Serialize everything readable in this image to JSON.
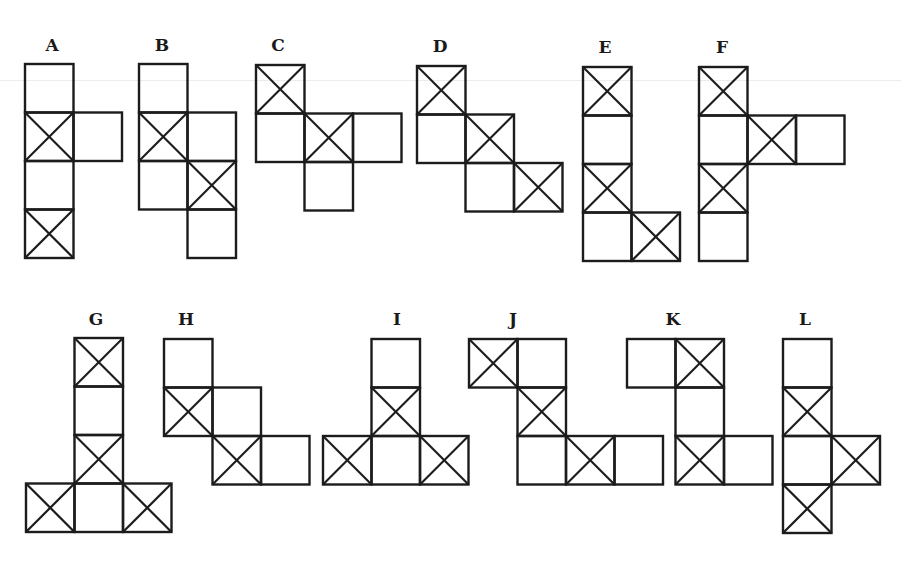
{
  "page": {
    "background": "#ffffff",
    "stroke_color": "#1c1c1c",
    "cell_size": 48.5,
    "top_fragment_text": ""
  },
  "figures": [
    {
      "label": "A",
      "label_x": 52,
      "label_y": 35,
      "x": 24,
      "y": 63,
      "cells": [
        [
          0,
          0,
          false
        ],
        [
          0,
          1,
          true
        ],
        [
          1,
          1,
          false
        ],
        [
          0,
          2,
          false
        ],
        [
          0,
          3,
          true
        ]
      ]
    },
    {
      "label": "B",
      "label_x": 162,
      "label_y": 35,
      "x": 138,
      "y": 63,
      "cells": [
        [
          0,
          0,
          false
        ],
        [
          0,
          1,
          true
        ],
        [
          1,
          1,
          false
        ],
        [
          0,
          2,
          false
        ],
        [
          1,
          2,
          true
        ],
        [
          1,
          3,
          false
        ]
      ]
    },
    {
      "label": "C",
      "label_x": 278,
      "label_y": 35,
      "x": 255,
      "y": 64,
      "cells": [
        [
          0,
          0,
          true
        ],
        [
          0,
          1,
          false
        ],
        [
          1,
          1,
          true
        ],
        [
          2,
          1,
          false
        ],
        [
          1,
          2,
          false
        ]
      ]
    },
    {
      "label": "D",
      "label_x": 440,
      "label_y": 36,
      "x": 416,
      "y": 65,
      "cells": [
        [
          0,
          0,
          true
        ],
        [
          0,
          1,
          false
        ],
        [
          1,
          1,
          true
        ],
        [
          1,
          2,
          false
        ],
        [
          2,
          2,
          true
        ]
      ]
    },
    {
      "label": "E",
      "label_x": 605,
      "label_y": 37,
      "x": 582,
      "y": 66,
      "cells": [
        [
          0,
          0,
          true
        ],
        [
          0,
          1,
          false
        ],
        [
          0,
          2,
          true
        ],
        [
          0,
          3,
          false
        ],
        [
          1,
          3,
          true
        ]
      ]
    },
    {
      "label": "F",
      "label_x": 722,
      "label_y": 37,
      "x": 698,
      "y": 66,
      "cells": [
        [
          0,
          0,
          true
        ],
        [
          0,
          1,
          false
        ],
        [
          1,
          1,
          true
        ],
        [
          2,
          1,
          false
        ],
        [
          0,
          2,
          true
        ],
        [
          0,
          3,
          false
        ]
      ]
    },
    {
      "label": "G",
      "label_x": 96,
      "label_y": 309,
      "x": 25,
      "y": 337,
      "cells": [
        [
          1,
          0,
          true
        ],
        [
          1,
          1,
          false
        ],
        [
          1,
          2,
          true
        ],
        [
          0,
          3,
          true
        ],
        [
          1,
          3,
          false
        ],
        [
          2,
          3,
          true
        ]
      ]
    },
    {
      "label": "H",
      "label_x": 186,
      "label_y": 309,
      "x": 163,
      "y": 338,
      "cells": [
        [
          0,
          0,
          false
        ],
        [
          0,
          1,
          true
        ],
        [
          1,
          1,
          false
        ],
        [
          1,
          2,
          true
        ],
        [
          2,
          2,
          false
        ]
      ]
    },
    {
      "label": "I",
      "label_x": 397,
      "label_y": 309,
      "x": 322,
      "y": 338,
      "cells": [
        [
          1,
          0,
          false
        ],
        [
          1,
          1,
          true
        ],
        [
          0,
          2,
          true
        ],
        [
          1,
          2,
          false
        ],
        [
          2,
          2,
          true
        ]
      ]
    },
    {
      "label": "J",
      "label_x": 513,
      "label_y": 309,
      "x": 468,
      "y": 338,
      "cells": [
        [
          0,
          0,
          true
        ],
        [
          1,
          0,
          false
        ],
        [
          1,
          1,
          true
        ],
        [
          1,
          2,
          false
        ],
        [
          2,
          2,
          true
        ],
        [
          3,
          2,
          false
        ]
      ]
    },
    {
      "label": "K",
      "label_x": 673,
      "label_y": 309,
      "x": 626,
      "y": 338,
      "cells": [
        [
          0,
          0,
          false
        ],
        [
          1,
          0,
          true
        ],
        [
          1,
          1,
          false
        ],
        [
          1,
          2,
          true
        ],
        [
          2,
          2,
          false
        ]
      ]
    },
    {
      "label": "L",
      "label_x": 805,
      "label_y": 309,
      "x": 782,
      "y": 338,
      "cells": [
        [
          0,
          0,
          false
        ],
        [
          0,
          1,
          true
        ],
        [
          0,
          2,
          false
        ],
        [
          1,
          2,
          true
        ],
        [
          0,
          3,
          true
        ]
      ]
    }
  ]
}
